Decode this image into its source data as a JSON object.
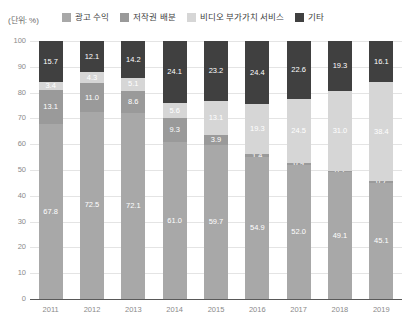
{
  "unit_label": "(단위: %)",
  "legend": {
    "items": [
      {
        "label": "광고 수익",
        "color": "#a8a8a8",
        "key": "ad_revenue"
      },
      {
        "label": "저작권 배분",
        "color": "#9a9a9a",
        "key": "copyright"
      },
      {
        "label": "비디오 부가가치 서비스",
        "color": "#d6d6d6",
        "key": "video_vas"
      },
      {
        "label": "기타",
        "color": "#404040",
        "key": "other"
      }
    ]
  },
  "chart_data": {
    "type": "bar",
    "stacked": true,
    "stack_total": 100,
    "title": "",
    "subtitle": "",
    "xlabel": "",
    "ylabel": "",
    "unit": "%",
    "ylim": [
      0,
      100
    ],
    "yticks": [
      100,
      90,
      80,
      70,
      60,
      50,
      40,
      30,
      20,
      10,
      0
    ],
    "grid": true,
    "legend_position": "top",
    "categories": [
      "2011",
      "2012",
      "2013",
      "2014",
      "2015",
      "2016",
      "2017",
      "2018",
      "2019"
    ],
    "series": [
      {
        "name": "광고 수익",
        "color": "#a8a8a8",
        "values": [
          67.8,
          72.5,
          72.1,
          61.0,
          59.7,
          54.9,
          52.0,
          49.1,
          45.1
        ]
      },
      {
        "name": "저작권 배분",
        "color": "#9a9a9a",
        "values": [
          13.1,
          11.0,
          8.6,
          9.3,
          3.9,
          1.4,
          0.9,
          0.7,
          0.7
        ]
      },
      {
        "name": "비디오 부가가치 서비스",
        "color": "#d6d6d6",
        "values": [
          3.4,
          4.3,
          5.1,
          5.6,
          13.1,
          19.3,
          24.5,
          31.0,
          38.4
        ]
      },
      {
        "name": "기타",
        "color": "#404040",
        "values": [
          15.7,
          12.1,
          14.2,
          24.1,
          23.2,
          24.4,
          22.6,
          19.3,
          16.1
        ]
      }
    ]
  }
}
